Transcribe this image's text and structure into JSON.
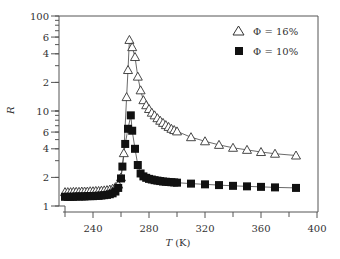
{
  "chart_data": {
    "type": "scatter",
    "title": "",
    "xlabel": "T (K)",
    "xlabel_italic": "T",
    "xlabel_unit": "(K)",
    "ylabel": "R",
    "xlim": [
      215,
      400
    ],
    "ylim": [
      1,
      100
    ],
    "yscale": "log",
    "grid": false,
    "legend_position": "upper right",
    "x_ticks": [
      240,
      280,
      320,
      360,
      400
    ],
    "x_minor_ticks": [
      220,
      260,
      300,
      340,
      380
    ],
    "y_tick_labels": [
      {
        "value": 100,
        "label": "100"
      },
      {
        "value": 60,
        "label": "6"
      },
      {
        "value": 40,
        "label": "4"
      },
      {
        "value": 20,
        "label": "2"
      },
      {
        "value": 10,
        "label": "10"
      },
      {
        "value": 6,
        "label": "6"
      },
      {
        "value": 4,
        "label": "4"
      },
      {
        "value": 2,
        "label": "2"
      },
      {
        "value": 1,
        "label": "1"
      }
    ],
    "series": [
      {
        "name": "Φ = 16%",
        "marker": "open-triangle",
        "x": [
          220,
          222,
          224,
          226,
          228,
          230,
          232,
          234,
          236,
          238,
          240,
          242,
          244,
          246,
          248,
          250,
          252,
          254,
          256,
          258,
          260,
          262,
          264,
          265,
          266,
          268,
          270,
          272,
          274,
          276,
          278,
          280,
          282,
          284,
          286,
          288,
          290,
          292,
          294,
          296,
          298,
          300,
          310,
          320,
          330,
          340,
          350,
          360,
          370,
          385
        ],
        "y": [
          1.4,
          1.4,
          1.4,
          1.41,
          1.41,
          1.41,
          1.42,
          1.42,
          1.42,
          1.43,
          1.43,
          1.44,
          1.44,
          1.45,
          1.46,
          1.47,
          1.49,
          1.52,
          1.58,
          1.68,
          2.0,
          3.6,
          14,
          27,
          56,
          47,
          37,
          23,
          16.5,
          13,
          11.5,
          10.5,
          9.6,
          9.0,
          8.4,
          7.9,
          7.5,
          7.1,
          6.8,
          6.5,
          6.3,
          6.1,
          5.3,
          4.8,
          4.4,
          4.1,
          3.9,
          3.7,
          3.55,
          3.4
        ]
      },
      {
        "name": "Φ = 10%",
        "marker": "filled-square",
        "x": [
          220,
          222,
          224,
          226,
          228,
          230,
          232,
          234,
          236,
          238,
          240,
          242,
          244,
          246,
          248,
          250,
          252,
          254,
          256,
          258,
          260,
          261,
          263,
          265,
          267,
          268,
          270,
          272,
          274,
          276,
          278,
          280,
          282,
          284,
          286,
          288,
          290,
          292,
          294,
          296,
          298,
          300,
          310,
          320,
          330,
          340,
          350,
          360,
          370,
          385
        ],
        "y": [
          1.25,
          1.25,
          1.25,
          1.25,
          1.26,
          1.26,
          1.26,
          1.26,
          1.27,
          1.27,
          1.27,
          1.28,
          1.28,
          1.29,
          1.3,
          1.31,
          1.33,
          1.36,
          1.42,
          1.55,
          1.95,
          2.6,
          4.5,
          6.5,
          9.0,
          6.2,
          4.0,
          2.7,
          2.2,
          2.05,
          1.98,
          1.93,
          1.9,
          1.87,
          1.85,
          1.83,
          1.81,
          1.8,
          1.79,
          1.78,
          1.77,
          1.76,
          1.72,
          1.69,
          1.66,
          1.63,
          1.61,
          1.59,
          1.57,
          1.55
        ]
      }
    ]
  },
  "legend": {
    "items": [
      {
        "label": "Φ = 16%",
        "marker": "open-triangle"
      },
      {
        "label": "Φ = 10%",
        "marker": "filled-square"
      }
    ]
  },
  "colors": {
    "axis": "#555555",
    "triangle_stroke": "#333333",
    "square_fill": "#111111",
    "line": "#444444"
  }
}
